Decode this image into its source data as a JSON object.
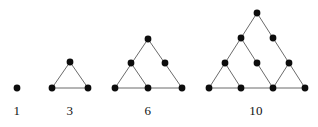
{
  "diagram": {
    "type": "dot-triangle-sequence",
    "canvas": {
      "width": 318,
      "height": 127
    },
    "style": {
      "background": "#ffffff",
      "dot_color": "#0d0d0d",
      "line_color": "#6b6b6b",
      "label_color": "#111111",
      "dot_radius": 3.4,
      "line_width": 1.0,
      "label_font_size": 13
    },
    "figures": [
      {
        "id": "figure-1",
        "label": "1",
        "rows": 1,
        "dot_count": 1,
        "label_x": 17,
        "label_y": 104,
        "nodes": [
          {
            "id": "f1-r1-c1",
            "x": 17,
            "y": 88
          }
        ],
        "edges": []
      },
      {
        "id": "figure-3",
        "label": "3",
        "rows": 2,
        "dot_count": 3,
        "label_x": 70,
        "label_y": 104,
        "nodes": [
          {
            "id": "f3-r1-c1",
            "x": 70,
            "y": 62
          },
          {
            "id": "f3-r2-c1",
            "x": 52,
            "y": 88
          },
          {
            "id": "f3-r2-c2",
            "x": 88,
            "y": 88
          }
        ],
        "edges": [
          {
            "x1": 70,
            "y1": 62,
            "x2": 52,
            "y2": 88
          },
          {
            "x1": 70,
            "y1": 62,
            "x2": 88,
            "y2": 88
          },
          {
            "x1": 52,
            "y1": 88,
            "x2": 88,
            "y2": 88
          }
        ]
      },
      {
        "id": "figure-6",
        "label": "6",
        "rows": 3,
        "dot_count": 6,
        "label_x": 148,
        "label_y": 104,
        "nodes": [
          {
            "id": "f6-r1-c1",
            "x": 148,
            "y": 39
          },
          {
            "id": "f6-r2-c1",
            "x": 131,
            "y": 63
          },
          {
            "id": "f6-r2-c2",
            "x": 165,
            "y": 63
          },
          {
            "id": "f6-r3-c1",
            "x": 115,
            "y": 88
          },
          {
            "id": "f6-r3-c2",
            "x": 148,
            "y": 88
          },
          {
            "id": "f6-r3-c3",
            "x": 182,
            "y": 88
          }
        ],
        "edges": [
          {
            "x1": 148,
            "y1": 39,
            "x2": 115,
            "y2": 88
          },
          {
            "x1": 148,
            "y1": 39,
            "x2": 182,
            "y2": 88
          },
          {
            "x1": 115,
            "y1": 88,
            "x2": 182,
            "y2": 88
          },
          {
            "x1": 131,
            "y1": 63,
            "x2": 148,
            "y2": 88
          }
        ]
      },
      {
        "id": "figure-10",
        "label": "10",
        "rows": 4,
        "dot_count": 10,
        "label_x": 256,
        "label_y": 104,
        "nodes": [
          {
            "id": "f10-r1-c1",
            "x": 257,
            "y": 13
          },
          {
            "id": "f10-r2-c1",
            "x": 241,
            "y": 38
          },
          {
            "id": "f10-r2-c2",
            "x": 273,
            "y": 38
          },
          {
            "id": "f10-r3-c1",
            "x": 225,
            "y": 63
          },
          {
            "id": "f10-r3-c2",
            "x": 257,
            "y": 63
          },
          {
            "id": "f10-r3-c3",
            "x": 289,
            "y": 63
          },
          {
            "id": "f10-r4-c1",
            "x": 209,
            "y": 88
          },
          {
            "id": "f10-r4-c2",
            "x": 241,
            "y": 88
          },
          {
            "id": "f10-r4-c3",
            "x": 273,
            "y": 88
          },
          {
            "id": "f10-r4-c4",
            "x": 305,
            "y": 88
          }
        ],
        "edges": [
          {
            "x1": 257,
            "y1": 13,
            "x2": 209,
            "y2": 88
          },
          {
            "x1": 257,
            "y1": 13,
            "x2": 305,
            "y2": 88
          },
          {
            "x1": 209,
            "y1": 88,
            "x2": 305,
            "y2": 88
          },
          {
            "x1": 241,
            "y1": 38,
            "x2": 273,
            "y2": 88
          },
          {
            "x1": 225,
            "y1": 63,
            "x2": 241,
            "y2": 88
          },
          {
            "x1": 289,
            "y1": 63,
            "x2": 273,
            "y2": 88
          }
        ]
      }
    ]
  }
}
